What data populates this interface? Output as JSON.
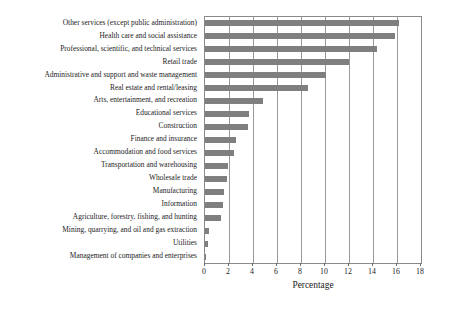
{
  "chart_data": {
    "type": "bar",
    "orientation": "horizontal",
    "title": "",
    "xlabel": "Percentage",
    "ylabel": "",
    "xlim": [
      0,
      18
    ],
    "xticks": [
      0,
      2,
      4,
      6,
      8,
      10,
      12,
      14,
      16,
      18
    ],
    "grid": true,
    "grid_axis": "x",
    "legend": "none",
    "bar_color": "#7f7f7f",
    "frame_color": "#8a8a8a",
    "categories": [
      "Other services (except public administration)",
      "Health care and social assistance",
      "Professional, scientific, and technical services",
      "Retail trade",
      "Administrative and support and waste management",
      "Real estate and rental/leasing",
      "Arts, entertainment, and recreation",
      "Educational services",
      "Construction",
      "Finance and insurance",
      "Accommodation and food services",
      "Transportation and warehousing",
      "Wholesale trade",
      "Manufacturing",
      "Information",
      "Agriculture, forestry, fishing, and hunting",
      "Mining, quarrying, and oil and gas extraction",
      "Utilities",
      "Management of companies and enterprises"
    ],
    "values": [
      16.2,
      15.8,
      14.3,
      12.0,
      10.1,
      8.6,
      4.8,
      3.7,
      3.6,
      2.6,
      2.4,
      1.9,
      1.8,
      1.6,
      1.5,
      1.3,
      0.3,
      0.25,
      0.05
    ]
  }
}
